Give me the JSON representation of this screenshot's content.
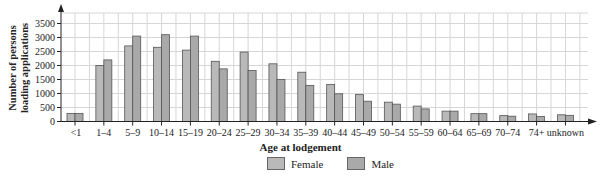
{
  "chart_data": {
    "type": "bar",
    "title": "",
    "xlabel": "Age at lodgement",
    "ylabel": "Number of persons loading applications",
    "ylabel_lines": [
      "Number of persons",
      "loading applications"
    ],
    "ylim": [
      0,
      3500
    ],
    "yticks": [
      0,
      500,
      1000,
      1500,
      2000,
      2500,
      3000,
      3500
    ],
    "grid": true,
    "legend_position": "bottom",
    "categories": [
      "<1",
      "1–4",
      "5–9",
      "10–14",
      "15–19",
      "20–24",
      "25–29",
      "30–34",
      "35–39",
      "40–44",
      "45–49",
      "50–54",
      "55–59",
      "60–64",
      "65–69",
      "70–74",
      "74+",
      "unknown"
    ],
    "series": [
      {
        "name": "Female",
        "color": "#b9b9b9",
        "values": [
          290,
          2000,
          2700,
          2650,
          2550,
          2150,
          2480,
          2060,
          1760,
          1320,
          960,
          690,
          550,
          370,
          280,
          210,
          270,
          240
        ]
      },
      {
        "name": "Male",
        "color": "#a9a9a9",
        "values": [
          290,
          2200,
          3050,
          3100,
          3050,
          1880,
          1820,
          1500,
          1290,
          990,
          725,
          620,
          450,
          370,
          280,
          190,
          180,
          220
        ]
      }
    ]
  }
}
